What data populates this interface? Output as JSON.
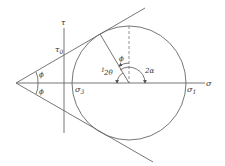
{
  "diagram": {
    "type": "Mohr circle with Mohr-Coulomb failure envelope",
    "labels": {
      "tau_axis": "τ",
      "sigma_axis": "σ",
      "tau0": "τ",
      "tau0_sub": "0",
      "sigma3": "σ",
      "sigma3_sub": "3",
      "sigma1": "σ",
      "sigma1_sub": "1",
      "phi_upper": "ϕ",
      "phi_lower": "ϕ",
      "phi_at_center": "ϕ",
      "two_theta": "2θ",
      "two_alpha": "2α",
      "theta_prefix": "1"
    },
    "colors": {
      "line": "#555555",
      "text": "#333333",
      "background": "#ffffff"
    }
  }
}
